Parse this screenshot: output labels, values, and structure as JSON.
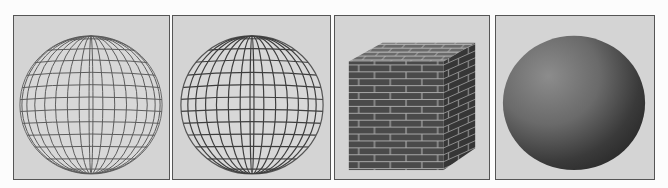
{
  "figure": {
    "panels": [
      {
        "id": "a",
        "label": "Wireframe sphere (latitude/longitude lines)",
        "render": "wireframe"
      },
      {
        "id": "b",
        "label": "Wireframe sphere with hidden-line shading",
        "render": "wireframe-shaded"
      },
      {
        "id": "c",
        "label": "Brick-textured cube",
        "render": "texture-mapped"
      },
      {
        "id": "d",
        "label": "Smooth shaded sphere",
        "render": "smooth-shaded"
      }
    ],
    "colors": {
      "background": "#d4d4d4",
      "border": "#555555",
      "line": "#555555",
      "brick": "#4a4a4a",
      "mortar": "#b0b0b0"
    }
  }
}
